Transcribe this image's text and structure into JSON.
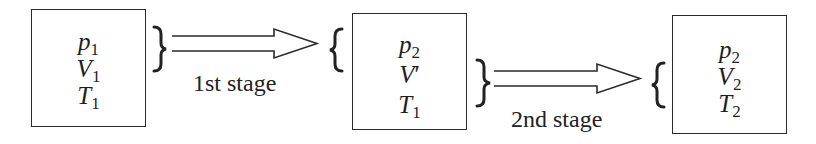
{
  "diagram": {
    "type": "process flow",
    "states": [
      {
        "id": "state-1",
        "vars": [
          {
            "sym": "p",
            "sub": "1",
            "prime": ""
          },
          {
            "sym": "V",
            "sub": "1",
            "prime": ""
          },
          {
            "sym": "T",
            "sub": "1",
            "prime": ""
          }
        ]
      },
      {
        "id": "state-2",
        "vars": [
          {
            "sym": "p",
            "sub": "2",
            "prime": ""
          },
          {
            "sym": "V",
            "sub": "",
            "prime": "′"
          },
          {
            "sym": "T",
            "sub": "1",
            "prime": ""
          }
        ]
      },
      {
        "id": "state-3",
        "vars": [
          {
            "sym": "p",
            "sub": "2",
            "prime": ""
          },
          {
            "sym": "V",
            "sub": "2",
            "prime": ""
          },
          {
            "sym": "T",
            "sub": "2",
            "prime": ""
          }
        ]
      }
    ],
    "transitions": [
      {
        "from": "state-1",
        "to": "state-2",
        "label": "1st stage"
      },
      {
        "from": "state-2",
        "to": "state-3",
        "label": "2nd stage"
      }
    ],
    "braces": {
      "open": "{",
      "close": "}"
    },
    "colors": {
      "stroke": "#2a2a2a",
      "text": "#1e1e1e",
      "background": "#ffffff"
    }
  }
}
